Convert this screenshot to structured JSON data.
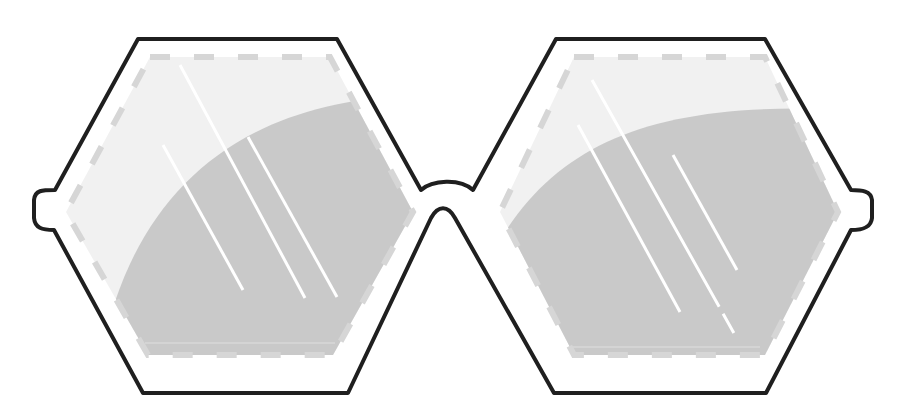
{
  "illustration": {
    "subject": "hexagonal-eyeglasses",
    "colors": {
      "background": "#ffffff",
      "frame_stroke": "#1f1f1f",
      "lens_light": "#f1f1f1",
      "lens_shade": "#c9c9c9",
      "dash_border": "#d6d6d6",
      "glare": "#ffffff"
    },
    "lenses": [
      {
        "id": "left",
        "glare_lines": 3
      },
      {
        "id": "right",
        "glare_lines": 3
      }
    ]
  }
}
